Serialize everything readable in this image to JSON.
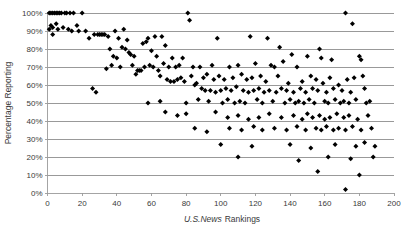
{
  "chart_data": {
    "type": "scatter",
    "title": "",
    "xlabel": "U.S.News Rankings",
    "xlabel_italic_part": "U.S.News",
    "xlabel_roman_part": "Rankings",
    "ylabel": "Percentage Reporting",
    "xlim": [
      0,
      200
    ],
    "ylim": [
      0,
      100
    ],
    "xticks": [
      0,
      20,
      40,
      60,
      80,
      100,
      120,
      140,
      160,
      180,
      200
    ],
    "xtick_labels": [
      "0",
      "20",
      "40",
      "60",
      "80",
      "100",
      "120",
      "140",
      "160",
      "180",
      "200"
    ],
    "yticks": [
      0,
      10,
      20,
      30,
      40,
      50,
      60,
      70,
      80,
      90,
      100
    ],
    "ytick_labels": [
      "0%",
      "10%",
      "20%",
      "30%",
      "40%",
      "50%",
      "60%",
      "70%",
      "80%",
      "90%",
      "100%"
    ],
    "grid": "horizontal",
    "legend": "none",
    "marker": "diamond",
    "marker_color": "#000000",
    "series": [
      {
        "name": "Percentage Reporting vs U.S.News Ranking",
        "points": [
          [
            1,
            100
          ],
          [
            2,
            100
          ],
          [
            3,
            100
          ],
          [
            4,
            100
          ],
          [
            5,
            100
          ],
          [
            6,
            100
          ],
          [
            7,
            100
          ],
          [
            8,
            100
          ],
          [
            10,
            100
          ],
          [
            11,
            100
          ],
          [
            13,
            100
          ],
          [
            15,
            100
          ],
          [
            20,
            100
          ],
          [
            81,
            100
          ],
          [
            82,
            96
          ],
          [
            172,
            100
          ],
          [
            176,
            94
          ],
          [
            1,
            91
          ],
          [
            2,
            93
          ],
          [
            3,
            92
          ],
          [
            5,
            94
          ],
          [
            6,
            91
          ],
          [
            9,
            92
          ],
          [
            12,
            91
          ],
          [
            14,
            90
          ],
          [
            17,
            93
          ],
          [
            18,
            90
          ],
          [
            22,
            90
          ],
          [
            3,
            88
          ],
          [
            24,
            86
          ],
          [
            27,
            88
          ],
          [
            29,
            88
          ],
          [
            30,
            88
          ],
          [
            31,
            88
          ],
          [
            32,
            88
          ],
          [
            33,
            88
          ],
          [
            35,
            87
          ],
          [
            39,
            90
          ],
          [
            41,
            86
          ],
          [
            44,
            91
          ],
          [
            46,
            85
          ],
          [
            55,
            83
          ],
          [
            57,
            84
          ],
          [
            58,
            86
          ],
          [
            62,
            87
          ],
          [
            66,
            87
          ],
          [
            68,
            82
          ],
          [
            98,
            86
          ],
          [
            117,
            87
          ],
          [
            127,
            86
          ],
          [
            36,
            80
          ],
          [
            43,
            81
          ],
          [
            45,
            80
          ],
          [
            47,
            78
          ],
          [
            60,
            79
          ],
          [
            134,
            81
          ],
          [
            157,
            80
          ],
          [
            38,
            76
          ],
          [
            40,
            75
          ],
          [
            48,
            77
          ],
          [
            50,
            76
          ],
          [
            63,
            76
          ],
          [
            72,
            75
          ],
          [
            78,
            75
          ],
          [
            141,
            77
          ],
          [
            150,
            76
          ],
          [
            158,
            75
          ],
          [
            164,
            74
          ],
          [
            180,
            76
          ],
          [
            181,
            74
          ],
          [
            34,
            69
          ],
          [
            37,
            71
          ],
          [
            42,
            70
          ],
          [
            49,
            71
          ],
          [
            52,
            68
          ],
          [
            53,
            68
          ],
          [
            54,
            68
          ],
          [
            56,
            70
          ],
          [
            59,
            71
          ],
          [
            61,
            70
          ],
          [
            64,
            68
          ],
          [
            67,
            72
          ],
          [
            70,
            70
          ],
          [
            74,
            70
          ],
          [
            76,
            71
          ],
          [
            84,
            70
          ],
          [
            88,
            70
          ],
          [
            95,
            71
          ],
          [
            105,
            70
          ],
          [
            110,
            71
          ],
          [
            120,
            72
          ],
          [
            129,
            71
          ],
          [
            131,
            70
          ],
          [
            136,
            73
          ],
          [
            144,
            70
          ],
          [
            51,
            66
          ],
          [
            65,
            65
          ],
          [
            69,
            63
          ],
          [
            71,
            62
          ],
          [
            73,
            62
          ],
          [
            75,
            63
          ],
          [
            77,
            64
          ],
          [
            79,
            62
          ],
          [
            83,
            65
          ],
          [
            86,
            61
          ],
          [
            90,
            64
          ],
          [
            92,
            66
          ],
          [
            96,
            63
          ],
          [
            99,
            65
          ],
          [
            102,
            63
          ],
          [
            107,
            64
          ],
          [
            112,
            66
          ],
          [
            115,
            63
          ],
          [
            118,
            64
          ],
          [
            123,
            65
          ],
          [
            126,
            62
          ],
          [
            133,
            65
          ],
          [
            139,
            61
          ],
          [
            147,
            62
          ],
          [
            152,
            65
          ],
          [
            155,
            63
          ],
          [
            159,
            61
          ],
          [
            163,
            64
          ],
          [
            168,
            60
          ],
          [
            173,
            63
          ],
          [
            177,
            64
          ],
          [
            182,
            65
          ],
          [
            85,
            60
          ],
          [
            89,
            58
          ],
          [
            91,
            57
          ],
          [
            94,
            57
          ],
          [
            97,
            56
          ],
          [
            100,
            57
          ],
          [
            103,
            58
          ],
          [
            106,
            57
          ],
          [
            109,
            59
          ],
          [
            113,
            57
          ],
          [
            116,
            56
          ],
          [
            119,
            57
          ],
          [
            122,
            58
          ],
          [
            125,
            56
          ],
          [
            128,
            57
          ],
          [
            132,
            56
          ],
          [
            135,
            58
          ],
          [
            138,
            57
          ],
          [
            142,
            56
          ],
          [
            146,
            58
          ],
          [
            149,
            56
          ],
          [
            153,
            58
          ],
          [
            156,
            57
          ],
          [
            161,
            56
          ],
          [
            165,
            58
          ],
          [
            170,
            57
          ],
          [
            175,
            56
          ],
          [
            183,
            58
          ],
          [
            26,
            58
          ],
          [
            28,
            56
          ],
          [
            87,
            52
          ],
          [
            93,
            51
          ],
          [
            101,
            50
          ],
          [
            104,
            52
          ],
          [
            108,
            50
          ],
          [
            111,
            51
          ],
          [
            114,
            50
          ],
          [
            121,
            52
          ],
          [
            124,
            50
          ],
          [
            130,
            51
          ],
          [
            137,
            50
          ],
          [
            140,
            52
          ],
          [
            143,
            50
          ],
          [
            145,
            51
          ],
          [
            148,
            50
          ],
          [
            151,
            52
          ],
          [
            154,
            50
          ],
          [
            160,
            51
          ],
          [
            162,
            50
          ],
          [
            166,
            52
          ],
          [
            169,
            50
          ],
          [
            171,
            51
          ],
          [
            174,
            50
          ],
          [
            178,
            52
          ],
          [
            184,
            50
          ],
          [
            186,
            51
          ],
          [
            58,
            50
          ],
          [
            65,
            51
          ],
          [
            80,
            50
          ],
          [
            80,
            44
          ],
          [
            97,
            45
          ],
          [
            104,
            42
          ],
          [
            110,
            43
          ],
          [
            116,
            41
          ],
          [
            122,
            42
          ],
          [
            128,
            44
          ],
          [
            135,
            42
          ],
          [
            142,
            43
          ],
          [
            147,
            41
          ],
          [
            150,
            44
          ],
          [
            153,
            42
          ],
          [
            157,
            43
          ],
          [
            160,
            41
          ],
          [
            163,
            42
          ],
          [
            167,
            44
          ],
          [
            171,
            42
          ],
          [
            174,
            43
          ],
          [
            179,
            41
          ],
          [
            185,
            43
          ],
          [
            68,
            45
          ],
          [
            75,
            43
          ],
          [
            105,
            36
          ],
          [
            112,
            35
          ],
          [
            119,
            37
          ],
          [
            124,
            35
          ],
          [
            131,
            36
          ],
          [
            138,
            35
          ],
          [
            144,
            37
          ],
          [
            149,
            35
          ],
          [
            155,
            36
          ],
          [
            158,
            35
          ],
          [
            161,
            37
          ],
          [
            165,
            35
          ],
          [
            168,
            36
          ],
          [
            172,
            35
          ],
          [
            176,
            37
          ],
          [
            181,
            35
          ],
          [
            187,
            36
          ],
          [
            85,
            36
          ],
          [
            92,
            34
          ],
          [
            100,
            27
          ],
          [
            118,
            26
          ],
          [
            140,
            27
          ],
          [
            152,
            25
          ],
          [
            166,
            27
          ],
          [
            178,
            26
          ],
          [
            183,
            28
          ],
          [
            189,
            26
          ],
          [
            110,
            20
          ],
          [
            145,
            18
          ],
          [
            162,
            20
          ],
          [
            175,
            19
          ],
          [
            188,
            20
          ],
          [
            156,
            12
          ],
          [
            180,
            10
          ],
          [
            172,
            2
          ]
        ]
      }
    ]
  },
  "axes": {
    "x_axis_name": "U.S.News Rankings",
    "y_axis_name": "Percentage Reporting"
  }
}
